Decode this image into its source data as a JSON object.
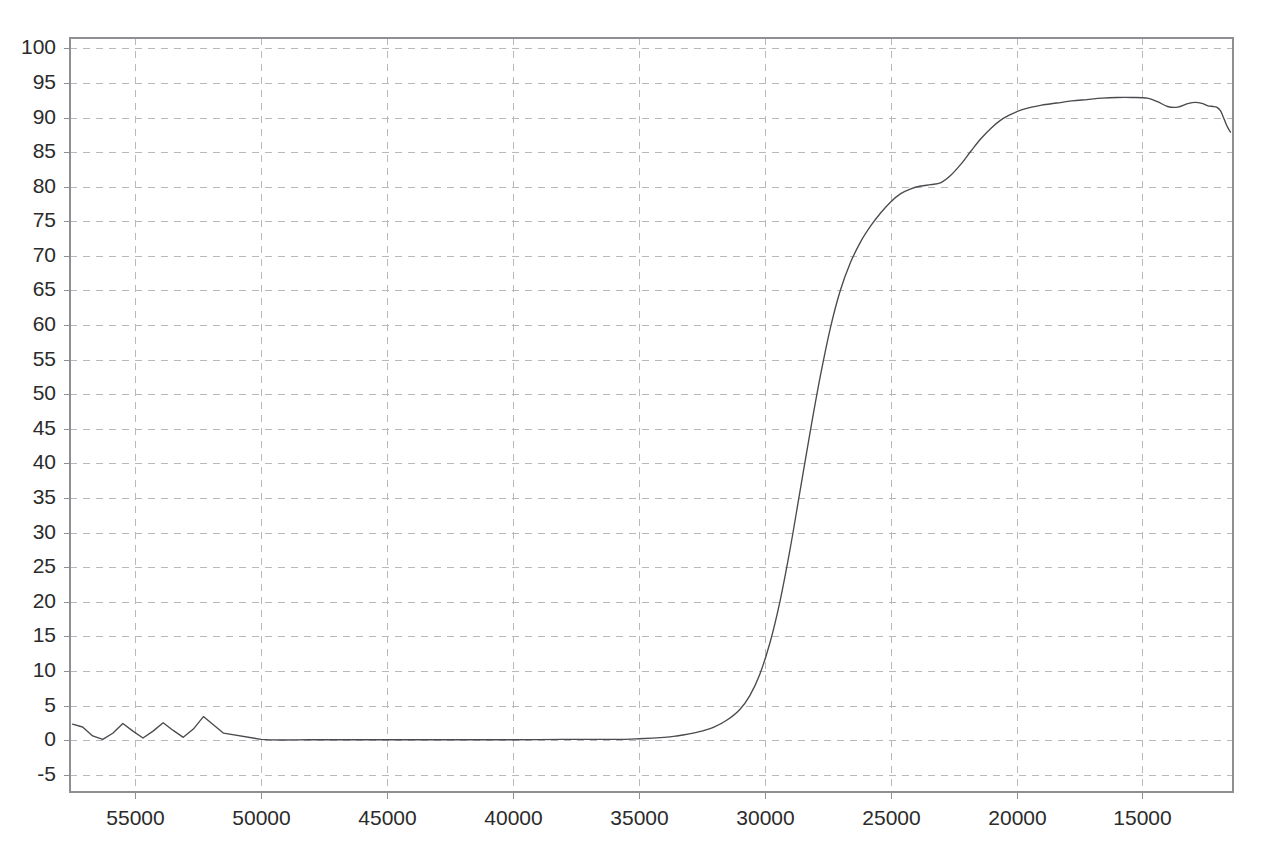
{
  "chart_data": {
    "type": "line",
    "title": "",
    "subtitle": "",
    "xlabel": "",
    "ylabel": "",
    "xlim": [
      57600,
      11400
    ],
    "ylim": [
      -7.5,
      101.5
    ],
    "x_axis_reversed": true,
    "grid": true,
    "grid_style": "dashed",
    "legend": "none",
    "xticks": [
      55000,
      50000,
      45000,
      40000,
      35000,
      30000,
      25000,
      20000,
      15000
    ],
    "xtick_labels": [
      "55000",
      "50000",
      "45000",
      "40000",
      "35000",
      "30000",
      "25000",
      "20000",
      "15000"
    ],
    "yticks": [
      100,
      95,
      90,
      85,
      80,
      75,
      70,
      65,
      60,
      55,
      50,
      45,
      40,
      35,
      30,
      25,
      20,
      15,
      10,
      5,
      0,
      -5
    ],
    "ytick_labels": [
      "100",
      "95",
      "90",
      "85",
      "80",
      "75",
      "70",
      "65",
      "60",
      "55",
      "50",
      "45",
      "40",
      "35",
      "30",
      "25",
      "20",
      "15",
      "10",
      "5",
      "0",
      "-5"
    ],
    "colors": {
      "curve": "#4a4a4f",
      "grid": "#b9b9bd",
      "axis": "#8e8e93",
      "background": "#ffffff",
      "tick_text": "#2b2b2b"
    },
    "series": [
      {
        "name": "Transmittance",
        "x": [
          57500,
          57100,
          56700,
          56300,
          55900,
          55500,
          55100,
          54700,
          54300,
          53900,
          53500,
          53100,
          52700,
          52300,
          51500,
          50000,
          48000,
          46000,
          44000,
          42000,
          40000,
          38000,
          36000,
          35000,
          34000,
          33500,
          33000,
          32500,
          32000,
          31500,
          31000,
          30600,
          30200,
          29800,
          29400,
          29000,
          28600,
          28200,
          27800,
          27400,
          27000,
          26600,
          26200,
          25800,
          25400,
          25000,
          24600,
          24200,
          23800,
          23400,
          23000,
          22600,
          22200,
          21800,
          21400,
          21000,
          20600,
          20200,
          19800,
          19400,
          19000,
          18400,
          17800,
          17200,
          16600,
          16000,
          15400,
          14800,
          14400,
          14000,
          13600,
          13200,
          12900,
          12600,
          12400,
          12200,
          12050,
          11900,
          11800,
          11700,
          11600,
          11500
        ],
        "y": [
          2.3,
          1.9,
          0.6,
          0.1,
          1.0,
          2.4,
          1.3,
          0.3,
          1.3,
          2.5,
          1.4,
          0.4,
          1.6,
          3.4,
          1.0,
          0.1,
          0.05,
          0.05,
          0.05,
          0.05,
          0.05,
          0.1,
          0.1,
          0.2,
          0.4,
          0.6,
          0.9,
          1.3,
          1.9,
          2.9,
          4.4,
          6.4,
          9.5,
          14.0,
          20.0,
          27.5,
          36.0,
          44.5,
          52.5,
          59.5,
          65.0,
          69.0,
          72.0,
          74.3,
          76.2,
          77.8,
          79.0,
          79.7,
          80.1,
          80.3,
          80.6,
          81.7,
          83.3,
          85.2,
          87.0,
          88.5,
          89.7,
          90.5,
          91.1,
          91.5,
          91.8,
          92.1,
          92.4,
          92.6,
          92.8,
          92.9,
          92.9,
          92.8,
          92.3,
          91.6,
          91.5,
          92.0,
          92.2,
          92.0,
          91.7,
          91.6,
          91.5,
          91.0,
          90.2,
          89.3,
          88.5,
          87.9
        ]
      }
    ]
  },
  "axes": {
    "tick_font_size": 21
  }
}
